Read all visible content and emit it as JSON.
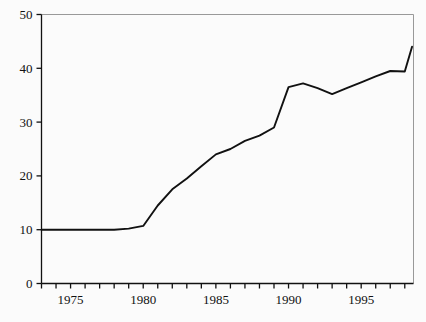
{
  "chart_data": {
    "type": "line",
    "title": "",
    "subtitle": "",
    "xlabel": "",
    "ylabel": "",
    "xlim": [
      1973,
      1998.6
    ],
    "ylim": [
      0,
      50
    ],
    "grid": false,
    "legend": "none",
    "axis_color": "#111111",
    "line_color": "#111111",
    "background_color": "#fbfbfb",
    "y_ticks": [
      0,
      10,
      20,
      30,
      40,
      50
    ],
    "y_tick_labels": [
      "0",
      "10",
      "20",
      "30",
      "40",
      "50"
    ],
    "x_ticks": [
      1973,
      1974,
      1975,
      1976,
      1977,
      1978,
      1979,
      1980,
      1981,
      1982,
      1983,
      1984,
      1985,
      1986,
      1987,
      1988,
      1989,
      1990,
      1991,
      1992,
      1993,
      1994,
      1995,
      1996,
      1997,
      1998
    ],
    "x_tick_labels_shown": [
      "1975",
      "1980",
      "1985",
      "1990",
      "1995"
    ],
    "x_labeled_ticks": [
      1975,
      1980,
      1985,
      1990,
      1995
    ],
    "x": [
      1973,
      1974,
      1975,
      1976,
      1977,
      1978,
      1979,
      1980,
      1981,
      1982,
      1983,
      1984,
      1985,
      1986,
      1987,
      1988,
      1989,
      1990,
      1991,
      1992,
      1993,
      1994,
      1995,
      1996,
      1997,
      1998,
      1998.5
    ],
    "values": [
      10,
      10,
      10,
      10,
      10,
      10,
      10.2,
      10.7,
      14.5,
      17.5,
      19.5,
      21.8,
      24,
      25,
      26.5,
      27.5,
      29,
      36.5,
      37.2,
      36.3,
      35.2,
      36.3,
      37.4,
      38.5,
      39.5,
      39.4,
      44
    ],
    "series": [
      {
        "name": "series-1",
        "values": [
          10,
          10,
          10,
          10,
          10,
          10,
          10.2,
          10.7,
          14.5,
          17.5,
          19.5,
          21.8,
          24,
          25,
          26.5,
          27.5,
          29,
          36.5,
          37.2,
          36.3,
          35.2,
          36.3,
          37.4,
          38.5,
          39.5,
          39.4,
          44
        ]
      }
    ]
  }
}
